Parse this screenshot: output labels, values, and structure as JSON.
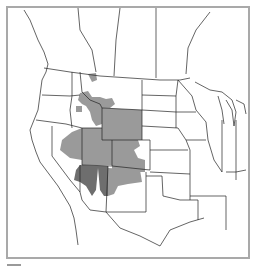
{
  "map": {
    "title": "",
    "region": "Western and Central North America (USA, southern Canada, northern Mexico)",
    "colors": {
      "background": "#ffffff",
      "frame": "#a9a9a9",
      "state_border": "#222222",
      "range_light": "#9a9a9a",
      "range_dark": "#6e6e6e"
    },
    "shaded_areas": [
      {
        "name": "range-primary",
        "shade": "light",
        "states": [
          "Montana (SW)",
          "Idaho (E)",
          "Wyoming",
          "Utah",
          "Nevada (E)",
          "Colorado",
          "New Mexico (N)"
        ]
      },
      {
        "name": "range-secondary",
        "shade": "dark",
        "states": [
          "Utah (S)",
          "Arizona (N)"
        ]
      }
    ]
  },
  "legend": {
    "items": [
      {
        "label": "",
        "color": "#9a9a9a"
      }
    ]
  }
}
